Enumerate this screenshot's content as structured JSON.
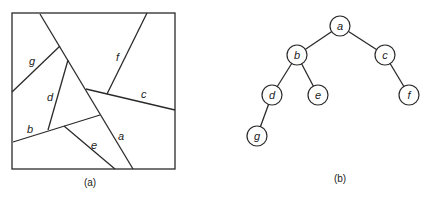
{
  "figure_a": {
    "caption": "(a)",
    "segment_labels": {
      "a": "a",
      "b": "b",
      "c": "c",
      "d": "d",
      "e": "e",
      "f": "f",
      "g": "g"
    }
  },
  "figure_b": {
    "caption": "(b)",
    "nodes": [
      {
        "id": "a",
        "label": "a"
      },
      {
        "id": "b",
        "label": "b"
      },
      {
        "id": "c",
        "label": "c"
      },
      {
        "id": "d",
        "label": "d"
      },
      {
        "id": "e",
        "label": "e"
      },
      {
        "id": "f",
        "label": "f"
      },
      {
        "id": "g",
        "label": "g"
      }
    ],
    "edges": [
      [
        "a",
        "b"
      ],
      [
        "a",
        "c"
      ],
      [
        "b",
        "d"
      ],
      [
        "b",
        "e"
      ],
      [
        "c",
        "f"
      ],
      [
        "d",
        "g"
      ]
    ]
  }
}
